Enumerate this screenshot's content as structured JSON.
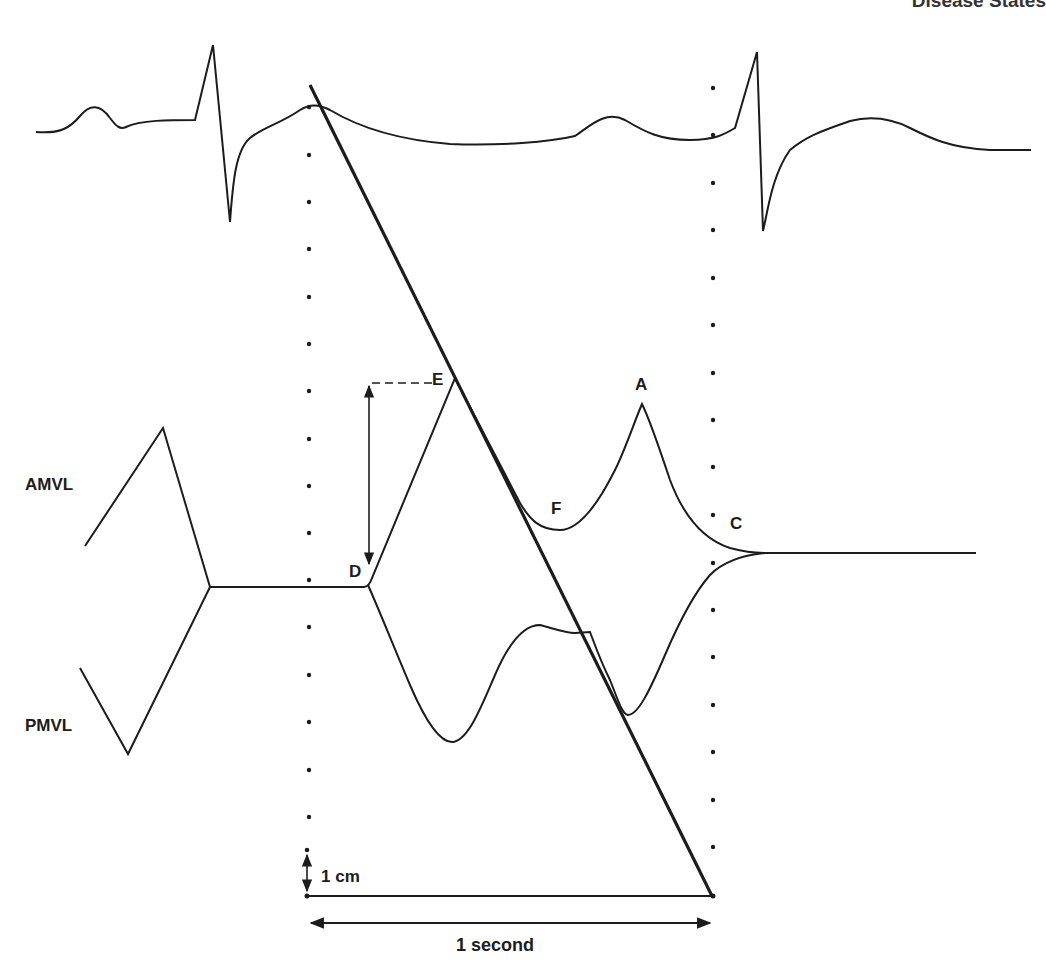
{
  "header": {
    "running_title": "Disease States"
  },
  "figure": {
    "traces": {
      "ecg": "ECG",
      "amvl": "AMVL",
      "pmvl": "PMVL"
    },
    "points": {
      "D": "D",
      "E": "E",
      "F": "F",
      "A": "A",
      "C": "C"
    },
    "scale": {
      "vertical": "1 cm",
      "horizontal": "1 second"
    }
  },
  "colors": {
    "ink": "#1c1c1c",
    "background": "#ffffff"
  }
}
